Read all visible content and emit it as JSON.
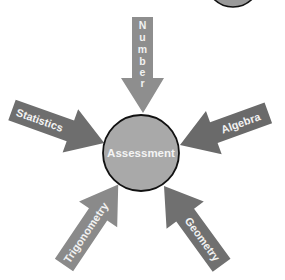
{
  "diagram": {
    "center": {
      "label": "Assessment",
      "fill": "#a9a9a9",
      "stroke": "#111111"
    },
    "corner_circle": {
      "fill": "#9a9a9a",
      "stroke": "#111111"
    },
    "arrows": [
      {
        "id": "number",
        "label": "Number",
        "letters": [
          "N",
          "u",
          "m",
          "b",
          "e",
          "r"
        ],
        "orientation": "vertical",
        "fill": "#8e8e8e"
      },
      {
        "id": "statistics",
        "label": "Statistics",
        "fill": "#6e6e6e"
      },
      {
        "id": "algebra",
        "label": "Algebra",
        "fill": "#6a6a6a"
      },
      {
        "id": "trigonometry",
        "label": "Trigonometry",
        "fill": "#8a8a8a"
      },
      {
        "id": "geometry",
        "label": "Geometry",
        "fill": "#707070"
      }
    ]
  }
}
